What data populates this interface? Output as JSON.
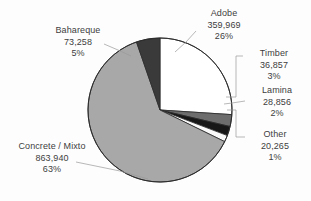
{
  "chart_data": {
    "type": "pie",
    "title": "",
    "subtitle": "",
    "xlabel": "",
    "ylabel": "",
    "legend_position": "none",
    "grid": false,
    "total": 1383145,
    "value_format": "comma-separated integers with percent of total",
    "categories": [
      "Adobe",
      "Timber",
      "Lamina",
      "Other",
      "Concrete / Mixto",
      "Bahareque"
    ],
    "values": [
      359969,
      36857,
      28856,
      20265,
      863940,
      73258
    ],
    "percents": [
      26,
      3,
      2,
      1,
      63,
      5
    ],
    "slices": [
      {
        "id": "adobe",
        "label": "Adobe",
        "value": 359969,
        "value_text": "359,969",
        "percent": 26,
        "percent_text": "26%",
        "color": "#ffffff",
        "stroke": "#2b2b2b"
      },
      {
        "id": "timber",
        "label": "Timber",
        "value": 36857,
        "value_text": "36,857",
        "percent": 3,
        "percent_text": "3%",
        "color": "#6d6d6d",
        "stroke": "#2b2b2b"
      },
      {
        "id": "lamina",
        "label": "Lamina",
        "value": 28856,
        "value_text": "28,856",
        "percent": 2,
        "percent_text": "2%",
        "color": "#171717",
        "stroke": "#2b2b2b"
      },
      {
        "id": "other",
        "label": "Other",
        "value": 20265,
        "value_text": "20,265",
        "percent": 1,
        "percent_text": "1%",
        "color": "#fafafa",
        "stroke": "#2b2b2b"
      },
      {
        "id": "concrete",
        "label": "Concrete / Mixto",
        "value": 863940,
        "value_text": "863,940",
        "percent": 63,
        "percent_text": "63%",
        "color": "#a8a8a8",
        "stroke": "#2b2b2b"
      },
      {
        "id": "bahareque",
        "label": "Bahareque",
        "value": 73258,
        "value_text": "73,258",
        "percent": 5,
        "percent_text": "5%",
        "color": "#3a3a3a",
        "stroke": "#2b2b2b"
      }
    ],
    "geometry": {
      "center_x": 160,
      "center_y": 110,
      "radius": 72,
      "start_angle_deg": -90,
      "direction": "clockwise"
    },
    "style": {
      "background": "#fdfdfd",
      "text_color": "#3d3d3d",
      "leader_color": "#9a9a9a",
      "outline_color": "#2b2b2b"
    }
  }
}
